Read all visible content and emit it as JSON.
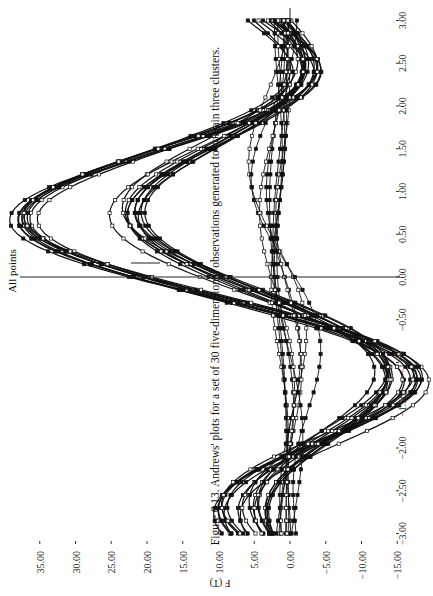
{
  "chart_data": {
    "type": "line",
    "title": "All points",
    "caption": "Figure 6.13. Andrews' plots for a set of 30 five-dimensional observations generated to contain three clusters.",
    "xlabel": "",
    "ylabel": "F (T)",
    "orientation": "rotated 90° (T axis vertical, F axis horizontal, page rotated counter-clockwise)",
    "x_ticks": [
      "-3.00",
      "-2.50",
      "-2.00",
      "-1.50",
      "-1.00",
      "-0.50",
      "0.00",
      "0.50",
      "1.00",
      "1.50",
      "2.00",
      "2.50",
      "3.00"
    ],
    "y_ticks": [
      "35.00",
      "30.00",
      "25.00",
      "20.00",
      "15.00",
      "10.00",
      "5.00",
      "0.00",
      "-5.00",
      "-10.00",
      "-15.00"
    ],
    "xlim": [
      -3.14,
      3.14
    ],
    "ylim": [
      -15,
      37
    ],
    "grid": false,
    "legend": null,
    "marker": "small squares on each curve",
    "annotations": [
      "vertical reference line at T = 0.00",
      "horizontal reference line at F = 0"
    ],
    "series": [
      {
        "name": "Cluster 1 (10 curves, large peak)",
        "approx_coeffs": {
          "x1_over_sqrt2": 7,
          "sin_t": 14,
          "cos_t": 8,
          "sin_2t": 14,
          "cos_2t": 6
        },
        "peak": 36,
        "peak_T": 0.5,
        "min": -14.5,
        "min_T": -1.5
      },
      {
        "name": "Cluster 2 (10 curves, medium peak)",
        "approx_coeffs": {
          "x1_over_sqrt2": 3,
          "sin_t": 10,
          "cos_t": 4,
          "sin_2t": 9,
          "cos_2t": 3
        },
        "peak": 19,
        "peak_T": 0.5,
        "min": -12,
        "min_T": -1.5
      },
      {
        "name": "Cluster 3 (10 curves, nearly flat)",
        "approx_coeffs": {
          "x1_over_sqrt2": 0.8,
          "sin_t": 0.8,
          "cos_t": 0.5,
          "sin_2t": 0.6,
          "cos_2t": 0.3
        },
        "range": [
          -2,
          5
        ]
      }
    ],
    "curve_count": 30
  }
}
